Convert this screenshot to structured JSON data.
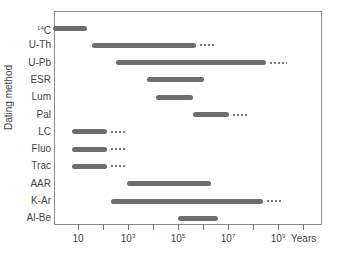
{
  "chart_data": {
    "type": "bar",
    "subtype": "horizontal-range (Gantt-style) on log axis",
    "title": "",
    "xlabel": "Years",
    "ylabel": "Dating method",
    "xscale": "log10",
    "xlim_log10": [
      0,
      10.8
    ],
    "x_tick_labels": [
      "10",
      "10³",
      "10⁵",
      "10⁷",
      "10⁹"
    ],
    "x_tick_positions_log10": [
      1,
      2,
      3,
      4,
      5,
      6,
      7,
      8,
      9,
      10
    ],
    "x_labeled_ticks_log10": [
      1,
      3,
      5,
      7,
      9
    ],
    "grid": false,
    "legend": null,
    "categories": [
      "¹⁴C",
      "U-Th",
      "U-Pb",
      "ESR",
      "Lum",
      "Pal",
      "LC",
      "Fluo",
      "Trac",
      "AAR",
      "K-Ar",
      "Al-Be"
    ],
    "ranges_log10": [
      {
        "method": "¹⁴C",
        "start": 0.0,
        "end": 1.35,
        "extension_end": null
      },
      {
        "method": "U-Th",
        "start": 1.55,
        "end": 5.7,
        "extension_end": 6.4
      },
      {
        "method": "U-Pb",
        "start": 2.5,
        "end": 8.5,
        "extension_end": 9.3
      },
      {
        "method": "ESR",
        "start": 3.75,
        "end": 6.05,
        "extension_end": null
      },
      {
        "method": "Lum",
        "start": 4.1,
        "end": 5.6,
        "extension_end": null
      },
      {
        "method": "Pal",
        "start": 5.6,
        "end": 7.05,
        "extension_end": 7.7
      },
      {
        "method": "LC",
        "start": 0.75,
        "end": 2.15,
        "extension_end": 2.85
      },
      {
        "method": "Fluo",
        "start": 0.75,
        "end": 2.15,
        "extension_end": 2.85
      },
      {
        "method": "Trac",
        "start": 0.75,
        "end": 2.15,
        "extension_end": 2.85
      },
      {
        "method": "AAR",
        "start": 2.95,
        "end": 6.3,
        "extension_end": null
      },
      {
        "method": "K-Ar",
        "start": 2.3,
        "end": 8.4,
        "extension_end": 9.1
      },
      {
        "method": "Al-Be",
        "start": 5.0,
        "end": 6.6,
        "extension_end": null
      }
    ]
  },
  "axis": {
    "ylabel": "Dating method",
    "xunit": "Years",
    "ticks": [
      {
        "label": "10",
        "base": "10",
        "exp": ""
      },
      {
        "label": "10³",
        "base": "10",
        "exp": "3"
      },
      {
        "label": "10⁵",
        "base": "10",
        "exp": "5"
      },
      {
        "label": "10⁷",
        "base": "10",
        "exp": "7"
      },
      {
        "label": "10⁹",
        "base": "10",
        "exp": "9"
      }
    ]
  },
  "rows": [
    {
      "label_pre": "14",
      "label": "C"
    },
    {
      "label_pre": "",
      "label": "U-Th"
    },
    {
      "label_pre": "",
      "label": "U-Pb"
    },
    {
      "label_pre": "",
      "label": "ESR"
    },
    {
      "label_pre": "",
      "label": "Lum"
    },
    {
      "label_pre": "",
      "label": "Pal"
    },
    {
      "label_pre": "",
      "label": "LC"
    },
    {
      "label_pre": "",
      "label": "Fluo"
    },
    {
      "label_pre": "",
      "label": "Trac"
    },
    {
      "label_pre": "",
      "label": "AAR"
    },
    {
      "label_pre": "",
      "label": "K-Ar"
    },
    {
      "label_pre": "",
      "label": "Al-Be"
    }
  ],
  "colors": {
    "bar": "#6e6e6e",
    "frame": "#8a8a8a",
    "text": "#444444"
  }
}
